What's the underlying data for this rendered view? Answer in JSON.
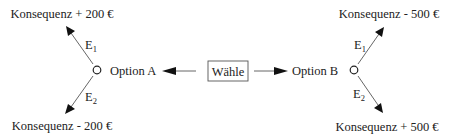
{
  "choice": {
    "label": "Wähle"
  },
  "options": [
    {
      "name": "Option A",
      "events": [
        {
          "label": "E",
          "subscript": "1",
          "consequence": "Konsequenz + 200 €"
        },
        {
          "label": "E",
          "subscript": "2",
          "consequence": "Konsequenz - 200 €"
        }
      ]
    },
    {
      "name": "Option B",
      "events": [
        {
          "label": "E",
          "subscript": "1",
          "consequence": "Konsequenz - 500 €"
        },
        {
          "label": "E",
          "subscript": "2",
          "consequence": "Konsequenz + 500 €"
        }
      ]
    }
  ]
}
